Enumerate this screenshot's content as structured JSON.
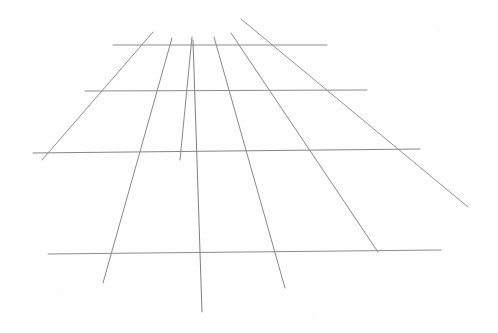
{
  "document": {
    "title": "Perspective Grid Sketch",
    "medium": "pencil-on-paper",
    "background_color": "#fefefe",
    "canvas": {
      "width": 498,
      "height": 333
    }
  },
  "drawing": {
    "kind": "one-point-perspective-ground-grid",
    "stroke_color": "#8a8a8a",
    "stroke_color_light": "#a2a2a2",
    "stroke_width": 1,
    "horizontal_lines": [
      {
        "name": "horizon-line-1",
        "x1": 113,
        "y1": 45,
        "x2": 327,
        "y2": 45,
        "stroke": "#8d8d8d",
        "width": 1
      },
      {
        "name": "horizon-line-2",
        "x1": 85,
        "y1": 91,
        "x2": 367,
        "y2": 90,
        "stroke": "#8d8d8d",
        "width": 1
      },
      {
        "name": "horizon-line-3",
        "x1": 33,
        "y1": 153,
        "x2": 420,
        "y2": 149,
        "stroke": "#868686",
        "width": 1
      },
      {
        "name": "horizon-line-4",
        "x1": 48,
        "y1": 254,
        "x2": 441,
        "y2": 250,
        "stroke": "#8d8d8d",
        "width": 1
      }
    ],
    "converging_lines": [
      {
        "name": "converging-line-1",
        "x1": 153,
        "y1": 32,
        "x2": 42,
        "y2": 160,
        "stroke": "#8f8f8f",
        "width": 1
      },
      {
        "name": "converging-line-2",
        "x1": 172,
        "y1": 38,
        "x2": 103,
        "y2": 283,
        "stroke": "#8a8a8a",
        "width": 1
      },
      {
        "name": "converging-line-3",
        "x1": 192,
        "y1": 37,
        "x2": 180,
        "y2": 160,
        "stroke": "#8a8a8a",
        "width": 1
      },
      {
        "name": "converging-line-4",
        "x1": 193,
        "y1": 40,
        "x2": 202,
        "y2": 312,
        "stroke": "#7f7f7f",
        "width": 1
      },
      {
        "name": "converging-line-5",
        "x1": 214,
        "y1": 37,
        "x2": 285,
        "y2": 288,
        "stroke": "#8a8a8a",
        "width": 1
      },
      {
        "name": "converging-line-6",
        "x1": 231,
        "y1": 33,
        "x2": 378,
        "y2": 252,
        "stroke": "#8a8a8a",
        "width": 1
      },
      {
        "name": "converging-line-7",
        "x1": 241,
        "y1": 19,
        "x2": 468,
        "y2": 207,
        "stroke": "#949494",
        "width": 1
      }
    ]
  }
}
